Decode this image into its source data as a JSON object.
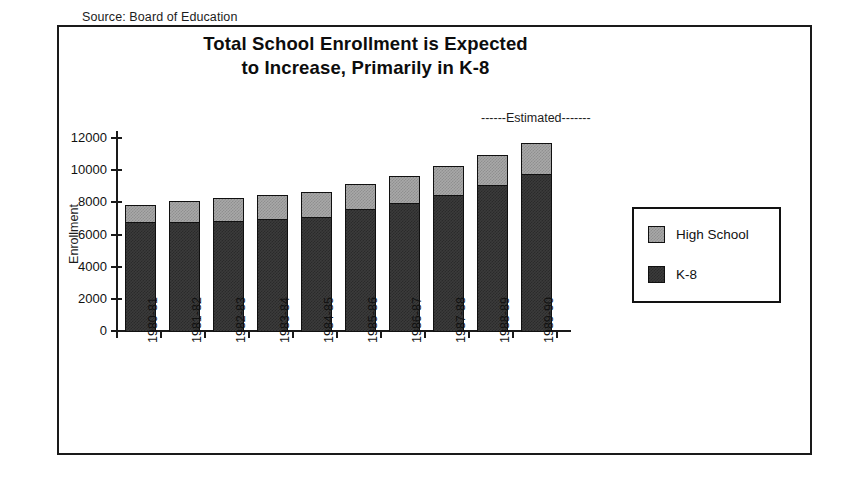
{
  "source_note": "Source:  Board of Education",
  "title_lines": [
    "Total School Enrollment is Expected",
    "to Increase, Primarily in K-8"
  ],
  "estimated_annotation": "------Estimated-------",
  "legend": {
    "items": [
      {
        "label": "High School",
        "color": "#a8a8a8",
        "name": "high-school"
      },
      {
        "label": "K-8",
        "color": "#3b3b3b",
        "name": "k8"
      }
    ]
  },
  "colors": {
    "high_school": "#a8a8a8",
    "k8": "#3b3b3b",
    "axis": "#1a1a1a",
    "frame": "#1a1a1a",
    "background": "#ffffff"
  },
  "chart_data": {
    "type": "bar",
    "stacked": true,
    "title": "Total School Enrollment is Expected to Increase, Primarily in K-8",
    "xlabel": "",
    "ylabel": "Enrollment",
    "ylim": [
      0,
      12000
    ],
    "ytick_labels": [
      "12000",
      "10000",
      "8000",
      "6000",
      "4000",
      "2000",
      "0"
    ],
    "yticks": [
      12000,
      10000,
      8000,
      6000,
      4000,
      2000,
      0
    ],
    "grid": false,
    "legend_position": "right",
    "categories": [
      "1980-81",
      "1981-82",
      "1982-83",
      "1983-84",
      "1984-85",
      "1985-86",
      "1986-87",
      "1987-88",
      "1988-89",
      "1989-90"
    ],
    "series": [
      {
        "name": "K-8",
        "color": "#3b3b3b",
        "values": [
          6800,
          6800,
          6900,
          7000,
          7100,
          7600,
          8000,
          8500,
          9100,
          9800
        ]
      },
      {
        "name": "High School",
        "color": "#a8a8a8",
        "values": [
          1200,
          1400,
          1500,
          1600,
          1700,
          1700,
          1750,
          1900,
          2000,
          2000
        ]
      }
    ],
    "totals": [
      8000,
      8200,
      8400,
      8600,
      8800,
      9300,
      9750,
      10400,
      11100,
      11800
    ],
    "annotations": [
      {
        "text": "------Estimated-------",
        "note": "covers later projected years"
      },
      {
        "text": "Source:  Board of Education",
        "note": "source line above title"
      }
    ]
  }
}
